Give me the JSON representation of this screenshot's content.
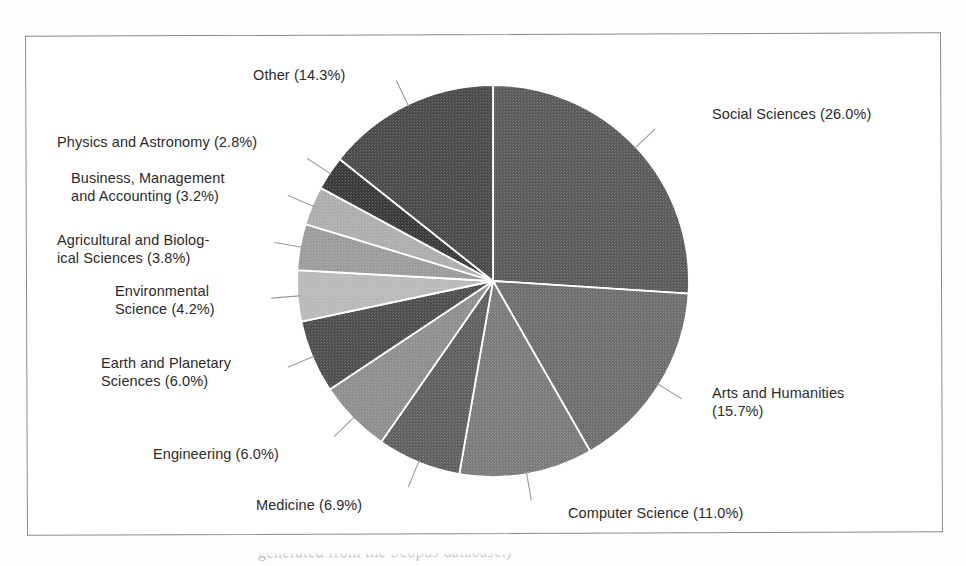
{
  "figure": {
    "background_color": "#ffffff",
    "frame_color": "#8a8a8a",
    "caption_partial": "generated from the Scopus database.)"
  },
  "chart_data": {
    "type": "pie",
    "title": "",
    "subtitle": "",
    "xlabel": "",
    "ylabel": "",
    "legend_position": "none",
    "labels_outside": true,
    "start_angle_deg": 0,
    "direction": "clockwise",
    "total_percent": 100.0,
    "categories": [
      "Social Sciences",
      "Arts and Humanities",
      "Computer Science",
      "Medicine",
      "Engineering",
      "Earth and Planetary Sciences",
      "Environmental Science",
      "Agricultural and Biological Sciences",
      "Business, Management and Accounting",
      "Physics and Astronomy",
      "Other"
    ],
    "values": [
      26.0,
      15.7,
      11.0,
      6.9,
      6.0,
      6.0,
      4.2,
      3.8,
      3.2,
      2.8,
      14.3
    ],
    "value_suffix": "%",
    "slice_colors": [
      "#5b5b5b",
      "#6e6e6e",
      "#7b7b7b",
      "#5f5f5f",
      "#8e8e8e",
      "#4e4e4e",
      "#b9b9b9",
      "#9b9b9b",
      "#adadad",
      "#3a3a3a",
      "#4a4a4a"
    ],
    "slice_separator_color": "#ffffff",
    "leader_line_color": "#9a9a9a"
  },
  "labels": [
    {
      "id": "social-sciences",
      "text": "Social Sciences (26.0%)",
      "category": "Social Sciences",
      "percent": "26.0%",
      "x": 712,
      "y": 106,
      "align": "left",
      "width": 230
    },
    {
      "id": "arts-and-humanities",
      "text": "Arts and Humanities\n(15.7%)",
      "category": "Arts and Humanities",
      "percent": "15.7%",
      "x": 712,
      "y": 385,
      "align": "left",
      "width": 200
    },
    {
      "id": "computer-science",
      "text": "Computer Science (11.0%)",
      "category": "Computer Science",
      "percent": "11.0%",
      "x": 568,
      "y": 505,
      "align": "left",
      "width": 250
    },
    {
      "id": "medicine",
      "text": "Medicine (6.9%)",
      "category": "Medicine",
      "percent": "6.9%",
      "x": 256,
      "y": 497,
      "align": "left",
      "width": 160
    },
    {
      "id": "engineering",
      "text": "Engineering (6.0%)",
      "category": "Engineering",
      "percent": "6.0%",
      "x": 153,
      "y": 446,
      "align": "left",
      "width": 180
    },
    {
      "id": "earth-and-planetary-sciences",
      "text": "Earth and Planetary\nSciences (6.0%)",
      "category": "Earth and Planetary Sciences",
      "percent": "6.0%",
      "x": 101,
      "y": 355,
      "align": "left",
      "width": 200
    },
    {
      "id": "environmental-science",
      "text": "Environmental\nScience (4.2%)",
      "category": "Environmental Science",
      "percent": "4.2%",
      "x": 115,
      "y": 283,
      "align": "left",
      "width": 170
    },
    {
      "id": "agricultural-and-biological-sciences",
      "text": "Agricultural and Biolog-\nical Sciences (3.8%)",
      "category": "Agricultural and Biological Sciences",
      "percent": "3.8%",
      "x": 57,
      "y": 232,
      "align": "left",
      "width": 240
    },
    {
      "id": "business-management-and-accounting",
      "text": "Business, Management\nand Accounting (3.2%)",
      "category": "Business, Management and Accounting",
      "percent": "3.2%",
      "x": 71,
      "y": 170,
      "align": "left",
      "width": 230
    },
    {
      "id": "physics-and-astronomy",
      "text": "Physics and Astronomy (2.8%)",
      "category": "Physics and Astronomy",
      "percent": "2.8%",
      "x": 57,
      "y": 134,
      "align": "left",
      "width": 250
    },
    {
      "id": "other",
      "text": "Other (14.3%)",
      "category": "Other",
      "percent": "14.3%",
      "x": 253,
      "y": 67,
      "align": "left",
      "width": 150
    }
  ]
}
